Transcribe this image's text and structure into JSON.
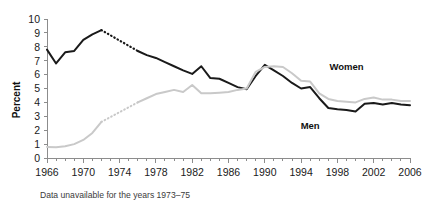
{
  "chart_data": {
    "type": "line",
    "title": "",
    "xlabel": "",
    "ylabel": "Percent",
    "xlim": [
      1966,
      2006
    ],
    "ylim": [
      0,
      10
    ],
    "grid": false,
    "legend_position": "inline-annotation",
    "xtick_labels": [
      "1966",
      "1970",
      "1974",
      "1978",
      "1982",
      "1986",
      "1990",
      "1994",
      "1998",
      "2002",
      "2006"
    ],
    "xtick_values": [
      1966,
      1970,
      1974,
      1978,
      1982,
      1986,
      1990,
      1994,
      1998,
      2002,
      2006
    ],
    "xtick_minor_step": 1,
    "ytick_labels": [
      "0",
      "1",
      "2",
      "3",
      "4",
      "5",
      "6",
      "7",
      "8",
      "9",
      "10"
    ],
    "ytick_values": [
      0,
      1,
      2,
      3,
      4,
      5,
      6,
      7,
      8,
      9,
      10
    ],
    "annotations": [
      {
        "text": "Women",
        "x": 1999,
        "y": 6.3
      },
      {
        "text": "Men",
        "x": 1995,
        "y": 2.1
      }
    ],
    "footnote": "Data unavailable for the years 1973–75",
    "missing_years": [
      1973,
      1974,
      1975
    ],
    "x": [
      1966,
      1967,
      1968,
      1969,
      1970,
      1971,
      1972,
      1976,
      1977,
      1978,
      1979,
      1980,
      1981,
      1982,
      1983,
      1984,
      1985,
      1986,
      1987,
      1988,
      1989,
      1990,
      1991,
      1992,
      1993,
      1994,
      1995,
      1996,
      1997,
      1998,
      1999,
      2000,
      2001,
      2002,
      2003,
      2004,
      2005,
      2006
    ],
    "series": [
      {
        "name": "Men",
        "color": "#1a1a1a",
        "style": "solid",
        "values": [
          7.8,
          6.8,
          7.6,
          7.7,
          8.5,
          8.9,
          9.2,
          7.7,
          7.4,
          7.2,
          6.9,
          6.6,
          6.3,
          6.05,
          6.6,
          5.75,
          5.7,
          5.4,
          5.1,
          4.95,
          5.9,
          6.7,
          6.3,
          5.9,
          5.4,
          5.0,
          5.1,
          4.3,
          3.6,
          3.5,
          3.45,
          3.35,
          3.9,
          3.95,
          3.85,
          3.95,
          3.85,
          3.8
        ],
        "dotted_segment": {
          "from": 1972,
          "to": 1976,
          "from_value": 9.2,
          "to_value": 7.7
        }
      },
      {
        "name": "Women",
        "color": "#c9c9c9",
        "style": "solid",
        "values": [
          0.8,
          0.78,
          0.85,
          1.0,
          1.3,
          1.8,
          2.6,
          4.0,
          4.3,
          4.6,
          4.75,
          4.9,
          4.75,
          5.25,
          4.65,
          4.65,
          4.7,
          4.75,
          4.9,
          5.0,
          6.2,
          6.55,
          6.6,
          6.55,
          6.1,
          5.55,
          5.5,
          4.65,
          4.25,
          4.1,
          4.05,
          4.0,
          4.25,
          4.35,
          4.2,
          4.2,
          4.1,
          4.1
        ],
        "dotted_segment": {
          "from": 1972,
          "to": 1976,
          "from_value": 2.6,
          "to_value": 4.0
        }
      }
    ]
  },
  "axis": {
    "ylabel": "Percent"
  },
  "footnote": {
    "text": "Data unavailable for the years 1973–75"
  }
}
